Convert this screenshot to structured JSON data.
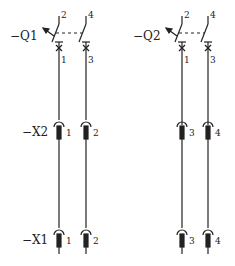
{
  "diagram": {
    "breakers": [
      {
        "id": "Q1",
        "label": "−Q1",
        "poles": [
          {
            "top": "2",
            "bottom": "1"
          },
          {
            "top": "4",
            "bottom": "3"
          }
        ]
      },
      {
        "id": "Q2",
        "label": "−Q2",
        "poles": [
          {
            "top": "2",
            "bottom": "1"
          },
          {
            "top": "4",
            "bottom": "3"
          }
        ]
      }
    ],
    "terminal_strips": [
      {
        "id": "X2",
        "label": "−X2",
        "terminals": [
          "1",
          "2",
          "3",
          "4"
        ]
      },
      {
        "id": "X1",
        "label": "−X1",
        "terminals": [
          "1",
          "2",
          "3",
          "4"
        ]
      }
    ],
    "colors": {
      "line": "#222222",
      "background": "#ffffff"
    }
  }
}
